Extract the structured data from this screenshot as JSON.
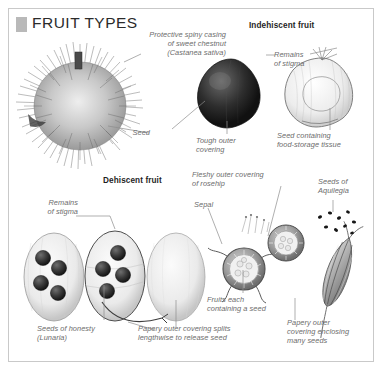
{
  "plate": {
    "title": "FRUIT TYPES"
  },
  "headings": [
    {
      "id": "indehiscent",
      "text": "Indehiscent fruit"
    },
    {
      "id": "dehiscent",
      "text": "Dehiscent fruit"
    }
  ],
  "labels": [
    {
      "id": "spiny-casing",
      "text": "Protective spiny casing\nof sweet chestnut\n(Castanea sativa)"
    },
    {
      "id": "seed",
      "text": "Seed"
    },
    {
      "id": "tough-outer-covering",
      "text": "Tough outer\ncovering"
    },
    {
      "id": "remains-of-stigma-top",
      "text": "Remains\nof stigma"
    },
    {
      "id": "seed-containing-food",
      "text": "Seed containing\nfood-storage tissue"
    },
    {
      "id": "remains-of-stigma-bottom",
      "text": "Remains\nof stigma"
    },
    {
      "id": "fleshy-outer-covering",
      "text": "Fleshy outer covering\nof rosehip"
    },
    {
      "id": "sepal",
      "text": "Sepal"
    },
    {
      "id": "seeds-of-aquilegia",
      "text": "Seeds of\nAquilegia"
    },
    {
      "id": "fruits-each-containing-seed",
      "text": "Fruits each\ncontaining a seed"
    },
    {
      "id": "seeds-of-honesty",
      "text": "Seeds of honesty\n(Lunaria)"
    },
    {
      "id": "papery-splits",
      "text": "Papery outer covering splits\nlengthwise to release seed"
    },
    {
      "id": "papery-enclosing",
      "text": "Papery outer\ncovering enclosing\nmany seeds"
    }
  ],
  "specimens": [
    {
      "id": "sweet-chestnut-spiny-casing",
      "name": "sweet chestnut spiny casing"
    },
    {
      "id": "chestnut-whole-fruit",
      "name": "whole chestnut fruit"
    },
    {
      "id": "chestnut-cut-fruit",
      "name": "cut chestnut fruit"
    },
    {
      "id": "honesty-seedpod-left",
      "name": "honesty seedpod with seeds"
    },
    {
      "id": "honesty-seedpod-middle",
      "name": "honesty seedpod with seeds"
    },
    {
      "id": "honesty-seedpod-right",
      "name": "empty honesty seedpod"
    },
    {
      "id": "rosehip-lower",
      "name": "rosehip cross-section"
    },
    {
      "id": "rosehip-upper",
      "name": "rosehip cross-section"
    },
    {
      "id": "aquilegia-pod",
      "name": "aquilegia seed pod"
    }
  ],
  "colors": {
    "title_marker": "#b9b9b9",
    "label_text": "#6c6c6c",
    "heading_text": "#1f1f1f",
    "border": "#c9c9c9",
    "leader_line": "#8d8d8d"
  }
}
